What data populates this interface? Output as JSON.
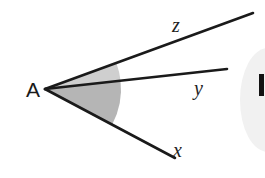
{
  "figure": {
    "type": "geometry-angle-diagram",
    "canvas": {
      "width": 265,
      "height": 178,
      "background": "#ffffff"
    },
    "vertex": {
      "name": "A",
      "label": "A",
      "point": {
        "x": 45,
        "y": 89
      },
      "label_position": {
        "x": 26,
        "y": 97
      }
    },
    "rays": [
      {
        "id": "ray-z",
        "label": "z",
        "from": {
          "x": 45,
          "y": 89
        },
        "to": {
          "x": 253,
          "y": 13
        },
        "label_position": {
          "x": 172,
          "y": 32
        },
        "stroke": "#1a1a1a",
        "stroke_width": 2.6
      },
      {
        "id": "ray-y",
        "label": "y",
        "from": {
          "x": 45,
          "y": 89
        },
        "to": {
          "x": 227,
          "y": 69
        },
        "label_position": {
          "x": 194,
          "y": 95
        },
        "stroke": "#1a1a1a",
        "stroke_width": 2.6
      },
      {
        "id": "ray-x",
        "label": "x",
        "from": {
          "x": 45,
          "y": 89
        },
        "to": {
          "x": 175,
          "y": 158
        },
        "label_position": {
          "x": 173,
          "y": 157
        },
        "stroke": "#1a1a1a",
        "stroke_width": 2.6
      }
    ],
    "sectors": [
      {
        "id": "sector-x-y",
        "name": "angle-x-y-shading",
        "fill": "#b5b5b5",
        "radius": 76,
        "between": [
          "x",
          "y"
        ],
        "path": "M 45 89 L 117.0 127.2 A 76 76 0 0 0 120.1 80.6 Z"
      },
      {
        "id": "sector-y-z",
        "name": "angle-y-z-shading",
        "fill": "#cfcfcf",
        "radius": 76,
        "between": [
          "y",
          "z"
        ],
        "path": "M 45 89 L 120.1 80.6 A 76 76 0 0 0 116.4 62.3 Z"
      }
    ],
    "artifacts": [
      {
        "id": "edge-blur-ellipse",
        "name": "page-edge-smudge",
        "fill": "#f1f1f1",
        "cx": 268,
        "cy": 100,
        "rx": 28,
        "ry": 52
      },
      {
        "id": "edge-dark-bar",
        "name": "page-edge-dark-bar",
        "color": "#121212",
        "left": 259,
        "top": 74,
        "width": 5,
        "height": 22
      }
    ]
  }
}
